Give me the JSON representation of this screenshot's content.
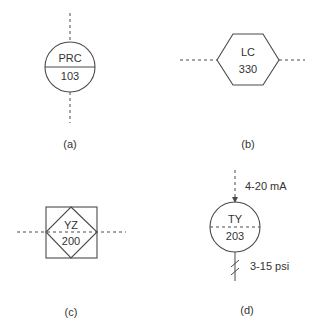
{
  "colors": {
    "line": "#4a4a4a",
    "text": "#333333",
    "background": "#ffffff"
  },
  "symbols": {
    "a": {
      "tag_top": "PRC",
      "tag_bottom": "103",
      "caption": "(a)",
      "shape": "circle-solid-divider",
      "connection": "vertical-dashed"
    },
    "b": {
      "tag_top": "LC",
      "tag_bottom": "330",
      "caption": "(b)",
      "shape": "hexagon",
      "connection": "horizontal-dashed"
    },
    "c": {
      "tag_top": "YZ",
      "tag_bottom": "200",
      "caption": "(c)",
      "shape": "diamond-in-square",
      "connection": "horizontal-dashed"
    },
    "d": {
      "tag_top": "TY",
      "tag_bottom": "203",
      "caption": "(d)",
      "shape": "circle-dashed-divider",
      "input_signal": "4-20 mA",
      "output_signal": "3-15 psi",
      "input_line": "dashed-arrow",
      "output_line": "pneumatic-hatched"
    }
  }
}
